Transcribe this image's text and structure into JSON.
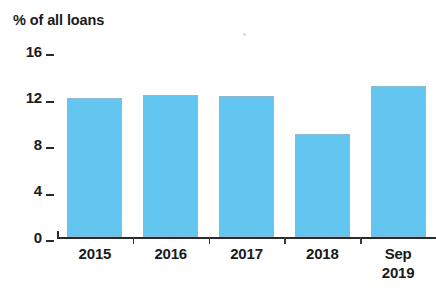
{
  "chart_data": {
    "type": "bar",
    "title": "% of all loans",
    "xlabel": "",
    "ylabel": "",
    "categories": [
      "2015",
      "2016",
      "2017",
      "2018",
      "Sep 2019"
    ],
    "category_lines": [
      [
        "2015"
      ],
      [
        "2016"
      ],
      [
        "2017"
      ],
      [
        "2018"
      ],
      [
        "Sep",
        "2019"
      ]
    ],
    "values": [
      12.0,
      12.2,
      12.1,
      8.9,
      13.0
    ],
    "ylim": [
      0,
      16
    ],
    "yticks": [
      0,
      4,
      8,
      12,
      16
    ],
    "ytick_labels": [
      "0",
      "4",
      "8",
      "12",
      "16"
    ],
    "grid": false,
    "legend": null,
    "bar_color": "#62c6f0",
    "bar_edge_color": "#8fb9cf",
    "axis_color": "#2b2b2b",
    "text_color": "#1a1a1a",
    "background": "#ffffff"
  }
}
